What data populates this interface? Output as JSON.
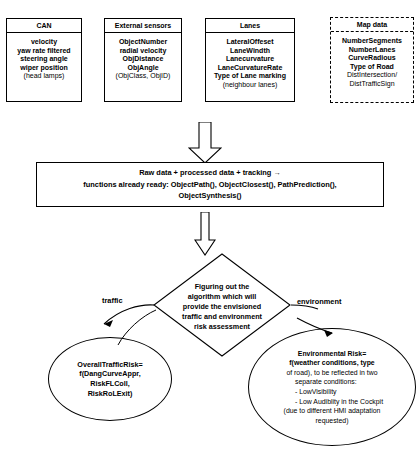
{
  "diagram": {
    "sources": [
      {
        "name": "can",
        "title": "CAN",
        "items": [
          "velocity",
          "yaw rate filtered",
          "steering angle",
          "wiper position"
        ],
        "note": "(head lamps)",
        "border": "solid"
      },
      {
        "name": "external-sensors",
        "title": "External sensors",
        "items": [
          "ObjectNumber",
          "radial velocity",
          "ObjDistance",
          "ObjAngle"
        ],
        "note": "(ObjClass, ObjID)",
        "border": "solid"
      },
      {
        "name": "lanes",
        "title": "Lanes",
        "items": [
          "LateralOffeset",
          "LaneWindth",
          "Lanecurvature",
          "LaneCurvatureRate",
          "Type of Lane marking"
        ],
        "note": "(neighbour lanes)",
        "border": "solid"
      },
      {
        "name": "map-data",
        "title": "Map data",
        "items": [
          "NumberSegments",
          "NumberLanes",
          "CurveRadious",
          "Type of Road"
        ],
        "note_lines": [
          "DistIntersection/",
          "DistTrafficSign"
        ],
        "border": "dashed"
      }
    ],
    "process_box": {
      "line1": "Raw data + processed data + tracking →",
      "line2": "functions already ready: ObjectPath(), ObjectClosest(), PathPrediction(),",
      "line3": "ObjectSynthesis()"
    },
    "decision": {
      "line1": "Figuring out the",
      "line2": "algorithm which will",
      "line3": "provide  the envisioned",
      "line4": "traffic and environment",
      "line5": "risk assessment"
    },
    "branches": {
      "left_label": "traffic",
      "right_label": "environment"
    },
    "traffic_outcome": {
      "line1": "OverallTrafficRisk=",
      "line2": "f(DangCurveAppr,",
      "line3": "RiskFLColl,",
      "line4": "RiskRoLExit)"
    },
    "environment_outcome": {
      "line1": "Environmental Risk=",
      "line2": "f(weather conditions, type",
      "line3": "of road), to be reflected in two",
      "line4": "separate conditions:",
      "line5": "- LowVisibility",
      "line6": "- Low Audiblity in the Cockpit",
      "line7": "(due to different HMI adaptation",
      "line8": "requested)"
    },
    "colors": {
      "stroke": "#000000",
      "background": "#ffffff"
    }
  }
}
